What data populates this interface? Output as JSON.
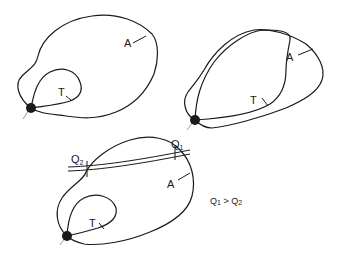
{
  "diagrams": [
    {
      "id": "panel-1",
      "labels": {
        "outer": "A",
        "inner": "T"
      }
    },
    {
      "id": "panel-2",
      "labels": {
        "outer": "A",
        "inner": "T"
      }
    },
    {
      "id": "panel-3",
      "labels": {
        "outer": "A",
        "inner": "T",
        "flow_downstream": "Q",
        "flow_downstream_sub": "1",
        "flow_upstream": "Q",
        "flow_upstream_sub": "2"
      }
    }
  ],
  "condition": {
    "left": "Q",
    "left_sub": "1",
    "op": " > ",
    "right": "Q",
    "right_sub": "2"
  },
  "colors": {
    "line": "#1a1a1a",
    "node": "#1a1a1a",
    "tail": "#9a9a9a",
    "background": "#ffffff"
  }
}
